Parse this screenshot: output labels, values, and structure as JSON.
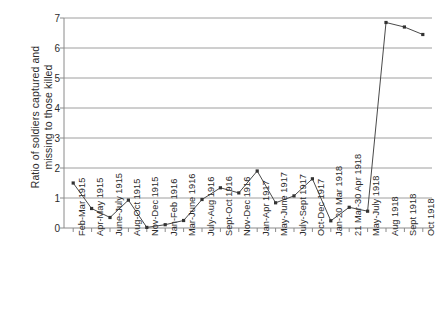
{
  "chart_data": {
    "type": "line",
    "title": "",
    "xlabel": "",
    "ylabel": "Ratio of soldiers captured and missing to those killed",
    "ylabel_lines": [
      "Ratio of soldiers captured and",
      "missing to those killed"
    ],
    "ylim": [
      0,
      7
    ],
    "yticks": [
      0,
      1,
      2,
      3,
      4,
      5,
      6,
      7
    ],
    "ytick_labels": [
      "0",
      "1",
      "2",
      "3",
      "4",
      "5",
      "6",
      "7"
    ],
    "grid": "horizontal",
    "legend": "none",
    "line_color": "#444444",
    "marker": "square",
    "marker_color": "#333333",
    "categories": [
      "Feb-Mar 1915",
      "Apr-May 1915",
      "June-July 1915",
      "Aug-Oct 1915",
      "Nov-Dec 1915",
      "Jan-Feb 1916",
      "Mar-June 1916",
      "July-Aug 1916",
      "Sept-Oct 1916",
      "Nov-Dec 1916",
      "Jan-Apr 1917",
      "May-June 1917",
      "July-Sept 1917",
      "Oct-Dec 1917",
      "Jan-20 Mar 1918",
      "21 Mar-30 Apr 1918",
      "May-July 1918",
      "Aug 1918",
      "Sept 1918",
      "Oct 1918"
    ],
    "values": [
      1.5,
      0.65,
      0.35,
      0.93,
      0.02,
      0.11,
      0.25,
      0.95,
      1.34,
      1.17,
      1.9,
      0.84,
      1.07,
      1.64,
      0.24,
      0.69,
      0.56,
      6.85,
      6.7,
      6.45
    ]
  }
}
